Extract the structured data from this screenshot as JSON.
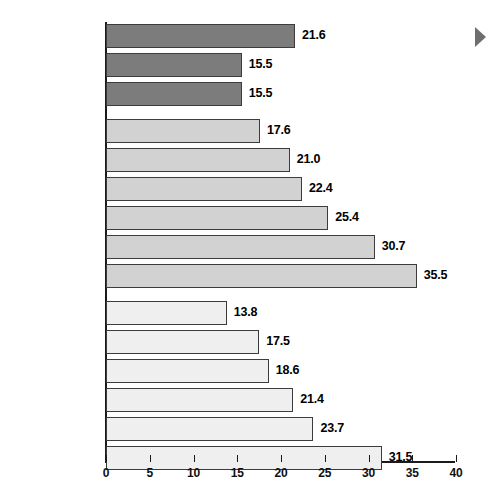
{
  "chart_data": {
    "type": "bar",
    "orientation": "horizontal",
    "title": "",
    "xlabel": "",
    "ylabel": "",
    "xlim": [
      0,
      40
    ],
    "xticks": [
      0,
      5,
      10,
      15,
      20,
      25,
      30,
      35,
      40
    ],
    "xtick_labels": [
      "0",
      "5",
      "10",
      "15",
      "20",
      "25",
      "30",
      "35",
      "40"
    ],
    "grid": false,
    "legend": false,
    "categories": [
      "All persons 2+",
      "Children 2–11",
      "Teens 12–17",
      "Women 18–24",
      "25–34",
      "35–49",
      "50–54",
      "55–59",
      "60+",
      "Men 18–24",
      "25–34",
      "35–49",
      "50–54",
      "55–59",
      "60+"
    ],
    "values": [
      21.6,
      15.5,
      15.5,
      17.6,
      21.0,
      22.4,
      25.4,
      30.7,
      35.5,
      13.8,
      17.5,
      18.6,
      21.4,
      23.7,
      31.5
    ],
    "value_labels": [
      "21.6",
      "15.5",
      "15.5",
      "17.6",
      "21.0",
      "22.4",
      "25.4",
      "30.7",
      "35.5",
      "13.8",
      "17.5",
      "18.6",
      "21.4",
      "23.7",
      "31.5"
    ],
    "groups": [
      {
        "name": "All persons / Children / Teens",
        "style": "dark",
        "color": "#7c7c7c",
        "bar_indices": [
          0,
          1,
          2
        ]
      },
      {
        "name": "Women",
        "style": "mid",
        "color": "#d2d2d2",
        "bar_indices": [
          3,
          4,
          5,
          6,
          7,
          8
        ]
      },
      {
        "name": "Men",
        "style": "light",
        "color": "#efefef",
        "bar_indices": [
          9,
          10,
          11,
          12,
          13,
          14
        ]
      }
    ],
    "bars": [
      {
        "label": "All persons 2+",
        "value": 21.6,
        "value_label": "21.6",
        "style": "dark",
        "top": 24
      },
      {
        "label": "Children 2–11",
        "value": 15.5,
        "value_label": "15.5",
        "style": "dark",
        "top": 53
      },
      {
        "label": "Teens 12–17",
        "value": 15.5,
        "value_label": "15.5",
        "style": "dark",
        "top": 82
      },
      {
        "label": "Women 18–24",
        "value": 17.6,
        "value_label": "17.6",
        "style": "mid",
        "top": 119
      },
      {
        "label": "25–34",
        "value": 21.0,
        "value_label": "21.0",
        "style": "mid",
        "top": 148
      },
      {
        "label": "35–49",
        "value": 22.4,
        "value_label": "22.4",
        "style": "mid",
        "top": 177
      },
      {
        "label": "50–54",
        "value": 25.4,
        "value_label": "25.4",
        "style": "mid",
        "top": 206
      },
      {
        "label": "55–59",
        "value": 30.7,
        "value_label": "30.7",
        "style": "mid",
        "top": 235
      },
      {
        "label": "60+",
        "value": 35.5,
        "value_label": "35.5",
        "style": "mid",
        "top": 264
      },
      {
        "label": "Men 18–24",
        "value": 13.8,
        "value_label": "13.8",
        "style": "light",
        "top": 301
      },
      {
        "label": "25–34",
        "value": 17.5,
        "value_label": "17.5",
        "style": "light",
        "top": 330
      },
      {
        "label": "35–49",
        "value": 18.6,
        "value_label": "18.6",
        "style": "light",
        "top": 359
      },
      {
        "label": "50–54",
        "value": 21.4,
        "value_label": "21.4",
        "style": "light",
        "top": 388
      },
      {
        "label": "55–59",
        "value": 23.7,
        "value_label": "23.7",
        "style": "light",
        "top": 417
      },
      {
        "label": "60+",
        "value": 31.5,
        "value_label": "31.5",
        "style": "light",
        "top": 446
      }
    ]
  },
  "markers": {
    "play_arrow": "play-arrow-icon"
  }
}
